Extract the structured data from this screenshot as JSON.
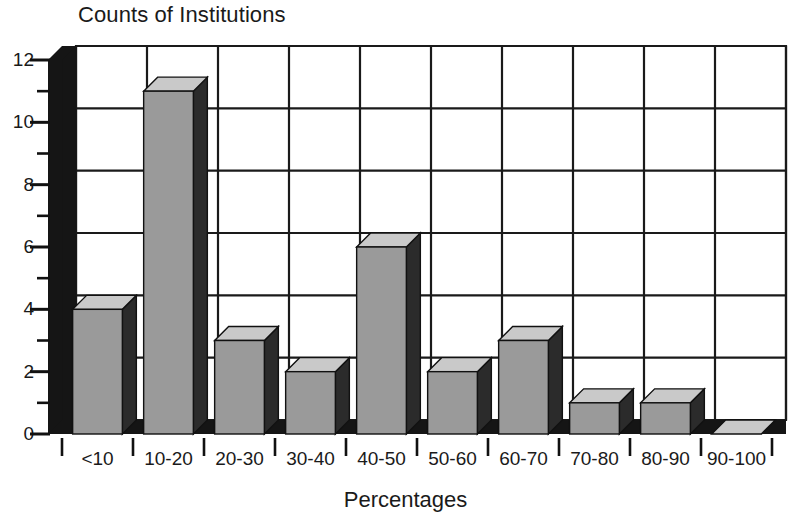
{
  "chart_data": {
    "type": "bar",
    "title": "Counts of Institutions",
    "xlabel": "Percentages",
    "ylabel": "",
    "categories": [
      "<10",
      "10-20",
      "20-30",
      "30-40",
      "40-50",
      "50-60",
      "60-70",
      "70-80",
      "80-90",
      "90-100"
    ],
    "values": [
      4,
      11,
      3,
      2,
      6,
      2,
      3,
      1,
      1,
      0
    ],
    "ylim": [
      0,
      12
    ],
    "ytick_labels": [
      "0",
      "2",
      "4",
      "6",
      "8",
      "10",
      "12"
    ],
    "ytick_values": [
      0,
      2,
      4,
      6,
      8,
      10,
      12
    ],
    "yminor_step": 1,
    "grid": true,
    "legend": false,
    "style": "3d-bars",
    "colors": {
      "bar_front": "#9a9a9a",
      "bar_top": "#c9c9c9",
      "bar_side": "#2b2b2b",
      "axis_wall": "#151515",
      "grid": "#1a1a1a",
      "background": "#ffffff",
      "text": "#1a1a1a"
    }
  },
  "title": {
    "text": "Counts of Institutions"
  },
  "axes": {
    "x_title": "Percentages",
    "y_title": ""
  }
}
